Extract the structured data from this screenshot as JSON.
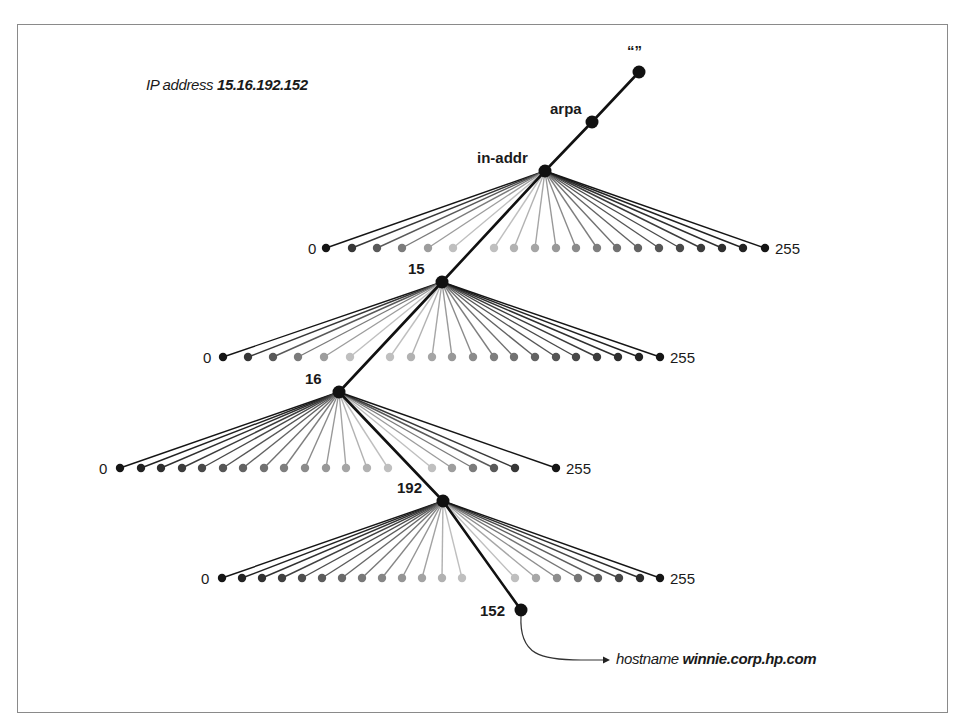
{
  "figure": {
    "title_prefix": "IP address",
    "title_address": "15.16.192.152",
    "root_label": "“”",
    "result_prefix": "hostname",
    "result_hostname": "winnie.corp.hp.com",
    "colors": {
      "line": "#111111",
      "node": "#111111",
      "border": "#8a8a8a",
      "leaf_dark": "#151515",
      "leaf_light": "#c8c8c8"
    }
  },
  "chain": [
    {
      "label": "“”",
      "x": 639,
      "y": 72,
      "label_dx": -12,
      "label_dy": -16
    },
    {
      "label": "arpa",
      "x": 592,
      "y": 122,
      "label_dx": -42,
      "label_dy": -8
    },
    {
      "label": "in-addr",
      "x": 545,
      "y": 171,
      "label_dx": -68,
      "label_dy": -8
    },
    {
      "label": "15",
      "x": 442,
      "y": 282,
      "label_dx": -34,
      "label_dy": -8
    },
    {
      "label": "16",
      "x": 339,
      "y": 392,
      "label_dx": -34,
      "label_dy": -8
    },
    {
      "label": "192",
      "x": 443,
      "y": 501,
      "label_dx": -46,
      "label_dy": -8
    },
    {
      "label": "152",
      "x": 521,
      "y": 610,
      "label_dx": -41,
      "label_dy": 6
    }
  ],
  "fans": [
    {
      "parent": "in-addr",
      "px": 545,
      "py": 171,
      "leaf_y": 248,
      "left_x": [
        326,
        352,
        377,
        402,
        428,
        453
      ],
      "right_x": [
        494,
        514,
        535,
        556,
        576,
        597,
        617,
        638,
        659,
        680,
        701,
        722,
        743,
        765
      ],
      "min_label": "0",
      "max_label": "255",
      "min_lx": 308,
      "max_lx": 775
    },
    {
      "parent": "15",
      "px": 442,
      "py": 282,
      "leaf_y": 357,
      "left_x": [
        223,
        248,
        273,
        298,
        324,
        350
      ],
      "right_x": [
        390,
        411,
        432,
        452,
        473,
        494,
        514,
        535,
        556,
        576,
        597,
        618,
        639,
        660
      ],
      "min_label": "0",
      "max_label": "255",
      "min_lx": 203,
      "max_lx": 670
    },
    {
      "parent": "16",
      "px": 339,
      "py": 392,
      "leaf_y": 468,
      "left_x": [
        120,
        141,
        161,
        182,
        202,
        223,
        243,
        264,
        284,
        305,
        326,
        346,
        367,
        388
      ],
      "right_x": [
        432,
        452,
        473,
        494,
        515,
        556
      ],
      "min_label": "0",
      "max_label": "255",
      "min_lx": 99,
      "max_lx": 566
    },
    {
      "parent": "192",
      "px": 443,
      "py": 501,
      "leaf_y": 578,
      "left_x": [
        222,
        242,
        262,
        282,
        302,
        322,
        342,
        362,
        382,
        402,
        422,
        442,
        462
      ],
      "right_x": [
        515,
        536,
        557,
        578,
        598,
        619,
        640,
        660
      ],
      "min_label": "0",
      "max_label": "255",
      "min_lx": 201,
      "max_lx": 670
    }
  ],
  "result_arrow": {
    "from_x": 521,
    "from_y": 610,
    "to_x": 610,
    "to_y": 660
  }
}
